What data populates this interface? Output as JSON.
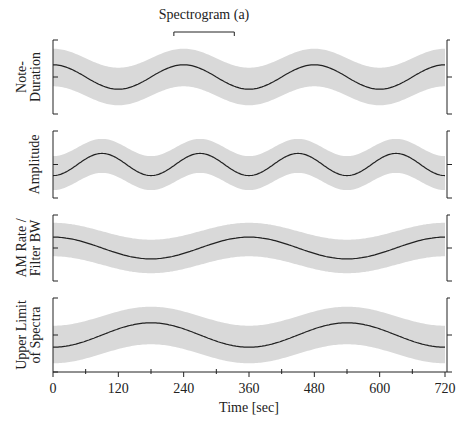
{
  "chart_data": {
    "type": "line",
    "title": "",
    "annotation": {
      "label": "Spectrogram (a)",
      "x_start": 222,
      "x_end": 333
    },
    "xlabel": "Time [sec]",
    "xlim": [
      0,
      720
    ],
    "x_ticks": [
      0,
      120,
      240,
      360,
      480,
      600,
      720
    ],
    "x_minor_ticks": [
      60,
      180,
      300,
      420,
      540,
      660
    ],
    "grid": false,
    "legend": null,
    "panels": [
      {
        "ylabel": [
          "Note-",
          "Duration"
        ],
        "shape": "cos",
        "period": 240,
        "phase": 0,
        "amplitude": 0.33,
        "band_halfwidth": 0.42,
        "band_color": "#d9d9d9",
        "line_color": "#222222"
      },
      {
        "ylabel": [
          "Amplitude"
        ],
        "shape": "-cos",
        "period": 180,
        "phase": 0,
        "amplitude": 0.33,
        "band_halfwidth": 0.42,
        "band_color": "#d9d9d9",
        "line_color": "#222222"
      },
      {
        "ylabel": [
          "AM Rate /",
          "Filter BW"
        ],
        "shape": "cos",
        "period": 360,
        "phase": 0,
        "amplitude": 0.33,
        "band_halfwidth": 0.42,
        "band_color": "#d9d9d9",
        "line_color": "#222222"
      },
      {
        "ylabel": [
          "Upper Limit",
          "of Spectra"
        ],
        "shape": "-cos",
        "period": 360,
        "phase": 0,
        "amplitude": 0.33,
        "band_halfwidth": 0.42,
        "band_color": "#d9d9d9",
        "line_color": "#222222"
      }
    ],
    "series": [
      {
        "name": "Note-Duration",
        "x": [
          0,
          120,
          240,
          360,
          480,
          600,
          720
        ],
        "values": [
          1,
          -1,
          1,
          -1,
          1,
          -1,
          1
        ]
      },
      {
        "name": "Amplitude",
        "x": [
          0,
          90,
          180,
          270,
          360,
          450,
          540,
          630,
          720
        ],
        "values": [
          -1,
          1,
          -1,
          1,
          -1,
          1,
          -1,
          1,
          -1
        ]
      },
      {
        "name": "AM Rate / Filter BW",
        "x": [
          0,
          180,
          360,
          540,
          720
        ],
        "values": [
          1,
          -1,
          1,
          -1,
          1
        ]
      },
      {
        "name": "Upper Limit of Spectra",
        "x": [
          0,
          180,
          360,
          540,
          720
        ],
        "values": [
          -1,
          1,
          -1,
          1,
          -1
        ]
      }
    ]
  }
}
